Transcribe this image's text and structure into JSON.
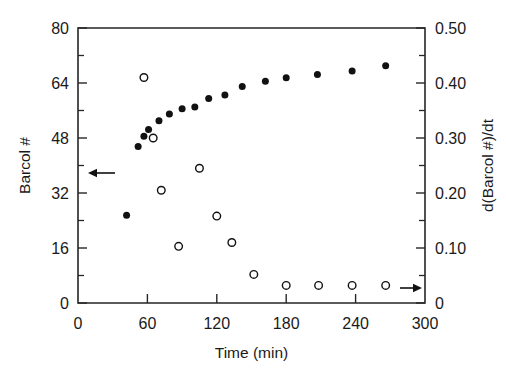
{
  "chart_data": {
    "type": "scatter",
    "title": "",
    "xlabel": "Time (min)",
    "ylabel": "Barcol #",
    "y2label": "d(Barcol #)/dt",
    "xlim": [
      0,
      300
    ],
    "ylim": [
      0,
      80
    ],
    "y2lim": [
      0,
      0.5
    ],
    "xticks": [
      0,
      60,
      120,
      180,
      240,
      300
    ],
    "xticklabels": [
      "0",
      "60",
      "120",
      "180",
      "240",
      "300"
    ],
    "yticks": [
      0,
      16,
      32,
      48,
      64,
      80
    ],
    "yticklabels": [
      "0",
      "16",
      "32",
      "48",
      "64",
      "80"
    ],
    "y2ticks": [
      0,
      0.1,
      0.2,
      0.3,
      0.4,
      0.5
    ],
    "y2ticklabels": [
      "0",
      "0.10",
      "0.20",
      "0.30",
      "0.40",
      "0.50"
    ],
    "y_minor_ticks": [
      8,
      24,
      40,
      56,
      72
    ],
    "y2_minor_ticks": [
      0.05,
      0.15,
      0.25,
      0.35,
      0.45
    ],
    "grid": false,
    "legend": "none",
    "series": [
      {
        "name": "Barcol #",
        "marker": "filled-circle",
        "axis": "left",
        "color": "#111111",
        "points": [
          {
            "x": 42,
            "y": 25.5
          },
          {
            "x": 52,
            "y": 45.5
          },
          {
            "x": 57,
            "y": 48.5
          },
          {
            "x": 61,
            "y": 50.5
          },
          {
            "x": 70,
            "y": 53.0
          },
          {
            "x": 79,
            "y": 55.0
          },
          {
            "x": 90,
            "y": 56.5
          },
          {
            "x": 101,
            "y": 57.0
          },
          {
            "x": 113,
            "y": 59.5
          },
          {
            "x": 127,
            "y": 60.5
          },
          {
            "x": 142,
            "y": 63.0
          },
          {
            "x": 162,
            "y": 64.5
          },
          {
            "x": 180,
            "y": 65.5
          },
          {
            "x": 207,
            "y": 66.5
          },
          {
            "x": 237,
            "y": 67.5
          },
          {
            "x": 266,
            "y": 69.0
          }
        ]
      },
      {
        "name": "d(Barcol #)/dt",
        "marker": "open-circle",
        "axis": "right",
        "color": "#111111",
        "points": [
          {
            "x": 57,
            "y": 0.41
          },
          {
            "x": 65,
            "y": 0.3
          },
          {
            "x": 72,
            "y": 0.205
          },
          {
            "x": 87,
            "y": 0.103
          },
          {
            "x": 105,
            "y": 0.245
          },
          {
            "x": 120,
            "y": 0.158
          },
          {
            "x": 133,
            "y": 0.11
          },
          {
            "x": 152,
            "y": 0.052
          },
          {
            "x": 180,
            "y": 0.032
          },
          {
            "x": 208,
            "y": 0.032
          },
          {
            "x": 237,
            "y": 0.032
          },
          {
            "x": 266,
            "y": 0.032
          }
        ]
      }
    ],
    "annotations": [
      {
        "name": "left-axis-arrow",
        "direction": "left",
        "x_start": 115,
        "x_end": 88,
        "y_px": 173
      },
      {
        "name": "right-axis-arrow",
        "direction": "right",
        "x_start": 400,
        "x_end": 422,
        "y_px": 288
      }
    ]
  }
}
